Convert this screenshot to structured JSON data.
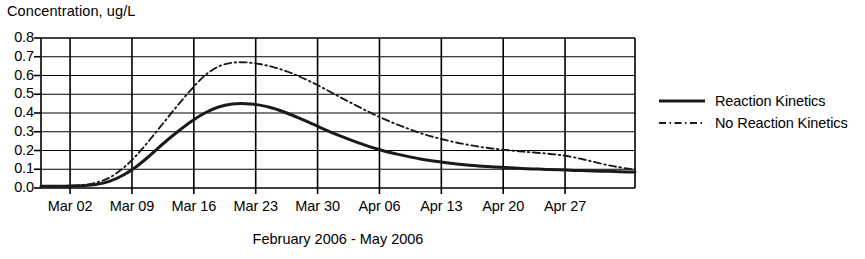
{
  "chart_data": {
    "type": "line",
    "title": "",
    "ylabel": "Concentration, ug/L",
    "xlabel": "February 2006 - May 2006",
    "ylim": [
      0.0,
      0.8
    ],
    "ytick_labels": [
      "0.8",
      "0.7",
      "0.6",
      "0.5",
      "0.4",
      "0.3",
      "0.2",
      "0.1",
      "0.0"
    ],
    "ytick_values": [
      0.8,
      0.7,
      0.6,
      0.5,
      0.4,
      0.3,
      0.2,
      0.1,
      0.0
    ],
    "xtick_labels": [
      "Mar 02",
      "Mar 09",
      "Mar 16",
      "Mar 23",
      "Mar 30",
      "Apr 06",
      "Apr 13",
      "Apr 20",
      "Apr 27"
    ],
    "grid": true,
    "legend_position": "right",
    "x_index_range": [
      0,
      87
    ],
    "series": [
      {
        "name": "Reaction Kinetics",
        "style": "solid",
        "color": "#1a1a1a",
        "x": [
          0,
          2,
          4,
          6,
          8,
          10,
          12,
          14,
          16,
          18,
          20,
          22,
          24,
          26,
          28,
          30,
          32,
          34,
          36,
          38,
          40,
          42,
          44,
          46,
          48,
          50,
          52,
          54,
          56,
          58,
          60,
          62,
          64,
          66,
          68,
          70,
          72,
          74,
          76,
          78,
          80,
          82,
          84,
          86,
          87
        ],
        "values": [
          0.01,
          0.01,
          0.01,
          0.012,
          0.018,
          0.035,
          0.068,
          0.115,
          0.175,
          0.24,
          0.3,
          0.355,
          0.4,
          0.432,
          0.448,
          0.45,
          0.442,
          0.425,
          0.4,
          0.37,
          0.338,
          0.305,
          0.275,
          0.247,
          0.222,
          0.2,
          0.182,
          0.166,
          0.152,
          0.141,
          0.132,
          0.124,
          0.118,
          0.113,
          0.109,
          0.105,
          0.102,
          0.099,
          0.097,
          0.094,
          0.092,
          0.09,
          0.088,
          0.086,
          0.085
        ]
      },
      {
        "name": "No Reaction Kinetics",
        "style": "dashdot",
        "color": "#1a1a1a",
        "x": [
          0,
          2,
          4,
          6,
          8,
          10,
          12,
          14,
          16,
          18,
          20,
          22,
          24,
          26,
          28,
          30,
          32,
          34,
          36,
          38,
          40,
          42,
          44,
          46,
          48,
          50,
          52,
          54,
          56,
          58,
          60,
          62,
          64,
          66,
          68,
          70,
          72,
          74,
          76,
          78,
          80,
          82,
          84,
          86,
          87
        ],
        "values": [
          0.01,
          0.01,
          0.012,
          0.016,
          0.028,
          0.055,
          0.105,
          0.175,
          0.26,
          0.35,
          0.44,
          0.525,
          0.6,
          0.648,
          0.668,
          0.67,
          0.661,
          0.645,
          0.622,
          0.592,
          0.558,
          0.52,
          0.481,
          0.443,
          0.406,
          0.372,
          0.341,
          0.313,
          0.288,
          0.267,
          0.249,
          0.234,
          0.221,
          0.211,
          0.203,
          0.196,
          0.19,
          0.184,
          0.176,
          0.164,
          0.148,
          0.13,
          0.115,
          0.103,
          0.098
        ]
      }
    ]
  },
  "legend": {
    "items": [
      {
        "label": "Reaction Kinetics",
        "style": "solid"
      },
      {
        "label": "No Reaction Kinetics",
        "style": "dashdot"
      }
    ]
  }
}
